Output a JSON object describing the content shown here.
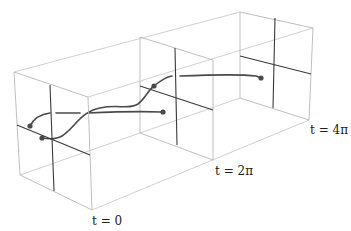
{
  "figure": {
    "type": "3d-wireframe-time-slices",
    "labels": {
      "t0": "t = 0",
      "t2pi": "t = 2π",
      "t4pi": "t = 4π"
    },
    "frames": [
      {
        "name": "t0",
        "corners": [
          [
            14,
            72
          ],
          [
            88,
            97
          ],
          [
            92,
            210
          ],
          [
            20,
            175
          ]
        ],
        "vline": [
          [
            50,
            85
          ],
          [
            54,
            191
          ]
        ],
        "hline": [
          [
            17,
            125
          ],
          [
            90,
            155
          ]
        ]
      },
      {
        "name": "t2pi",
        "corners": [
          [
            140,
            37
          ],
          [
            213,
            60
          ],
          [
            213,
            160
          ],
          [
            140,
            133
          ]
        ],
        "vline": [
          [
            175,
            48
          ],
          [
            177,
            145
          ]
        ],
        "hline": [
          [
            140,
            86
          ],
          [
            213,
            110
          ]
        ]
      },
      {
        "name": "t4pi",
        "corners": [
          [
            240,
            12
          ],
          [
            313,
            28
          ],
          [
            309,
            120
          ],
          [
            240,
            98
          ]
        ],
        "vline": [
          [
            275,
            18
          ],
          [
            273,
            108
          ]
        ],
        "hline": [
          [
            240,
            56
          ],
          [
            311,
            74
          ]
        ]
      }
    ],
    "colors": {
      "frame": "#b8b8b8",
      "cross": "#3a3a3a",
      "curve": "#4a4a4a"
    }
  }
}
